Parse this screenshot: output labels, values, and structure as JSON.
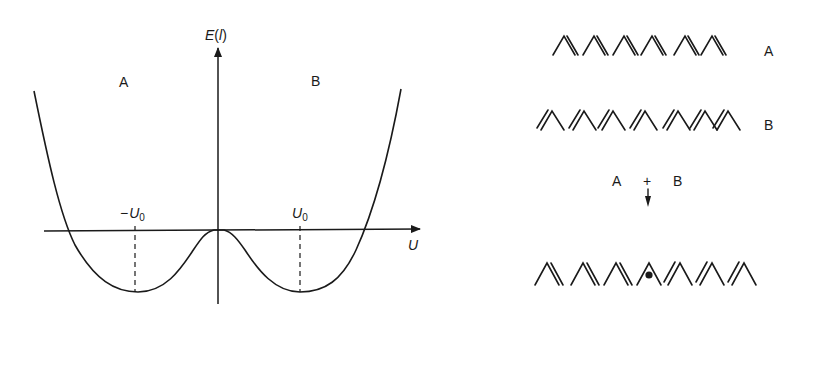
{
  "graph": {
    "y_axis_label": "E(l)",
    "y_axis_label_parts": {
      "E": "E",
      "open": "(",
      "l": "l",
      "close": ")"
    },
    "x_axis_label": "U",
    "region_left": "A",
    "region_right": "B",
    "tick_left": {
      "minus": "−",
      "symbol": "U",
      "sub": "0"
    },
    "tick_right": {
      "symbol": "U",
      "sub": "0"
    }
  },
  "chains": {
    "chain_a_label": "A",
    "chain_b_label": "B",
    "reaction": {
      "left": "A",
      "plus": "+",
      "right": "B"
    }
  },
  "colors": {
    "ink": "#1a1a1a",
    "background": "#ffffff"
  }
}
